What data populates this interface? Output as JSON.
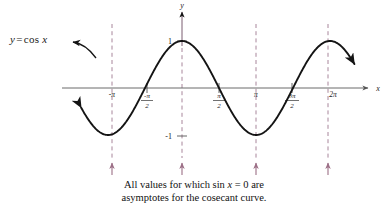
{
  "figure": {
    "function_label": {
      "lhs": "y",
      "equals": "=",
      "fname": "cos",
      "arg": "x",
      "full": "y = cos x"
    },
    "axes": {
      "x_axis_name": "x",
      "y_axis_name": "y",
      "x_ticks": [
        {
          "label": "-π",
          "value": -3.14159,
          "type": "plain"
        },
        {
          "label": "-π/2",
          "numerator": "-π",
          "denominator": "2",
          "value": -1.5708,
          "type": "fraction"
        },
        {
          "label": "π/2",
          "numerator": "π",
          "denominator": "2",
          "value": 1.5708,
          "type": "fraction"
        },
        {
          "label": "π",
          "value": 3.14159,
          "type": "plain"
        },
        {
          "label": "3π/2",
          "numerator": "3π",
          "denominator": "2",
          "value": 4.71239,
          "type": "fraction"
        },
        {
          "label": "2π",
          "value": 6.28319,
          "type": "plain"
        }
      ],
      "y_ticks": [
        {
          "label": "1",
          "value": 1
        },
        {
          "label": "-1",
          "value": -1
        }
      ]
    },
    "asymptotes": {
      "description": "vertical dashed asymptote lines at multiples of pi",
      "color": "#a8869b",
      "values": [
        -3.14159,
        0,
        3.14159,
        6.28319
      ],
      "labels": [
        "-π",
        "0",
        "π",
        "2π"
      ],
      "arrow_direction": "up",
      "count": 4
    },
    "caption": {
      "line1_a": "All values for which sin ",
      "line1_var": "x",
      "line1_b": " = 0 are",
      "line2": "asymptotes for the cosecant curve.",
      "full": "All values for which sin x = 0 are asymptotes for the cosecant curve."
    }
  },
  "chart_data": {
    "type": "line",
    "title": "",
    "xlabel": "x",
    "ylabel": "y",
    "xlim": [
      -4.4,
      7.5
    ],
    "ylim": [
      -1.55,
      1.55
    ],
    "grid": false,
    "legend": "none",
    "series": [
      {
        "name": "y = cos x",
        "expression": "cos(x)",
        "color": "#141414",
        "arrow_start": true,
        "arrow_end": true,
        "x": [
          -4.3,
          -4.0,
          -3.7,
          -3.4,
          -3.14159,
          -2.8,
          -2.5,
          -2.2,
          -1.9,
          -1.5708,
          -1.2,
          -0.9,
          -0.6,
          -0.3,
          0,
          0.3,
          0.6,
          0.9,
          1.2,
          1.5708,
          1.9,
          2.2,
          2.5,
          2.8,
          3.14159,
          3.5,
          3.8,
          4.1,
          4.4,
          4.71239,
          5.0,
          5.3,
          5.6,
          5.9,
          6.28319,
          6.6,
          6.9,
          7.2
        ],
        "y": [
          -0.37,
          -0.65,
          -0.84,
          -0.97,
          -1.0,
          -0.94,
          -0.8,
          -0.59,
          -0.32,
          0.0,
          0.36,
          0.62,
          0.83,
          0.96,
          1.0,
          0.96,
          0.83,
          0.62,
          0.36,
          0.0,
          -0.32,
          -0.59,
          -0.8,
          -0.94,
          -1.0,
          -0.94,
          -0.79,
          -0.51,
          -0.31,
          0.0,
          0.28,
          0.55,
          0.78,
          0.93,
          1.0,
          0.95,
          0.84,
          0.64
        ]
      }
    ],
    "annotations": [
      {
        "text": "y = cos x",
        "kind": "curve-label-with-arrow"
      },
      {
        "text": "All values for which sin x = 0 are asymptotes for the cosecant curve.",
        "kind": "caption"
      }
    ],
    "vlines": {
      "values": [
        -3.14159,
        0,
        3.14159,
        6.28319
      ],
      "style": "dashed",
      "color": "#a8869b",
      "note": "cosecant asymptotes where sin x = 0"
    }
  }
}
